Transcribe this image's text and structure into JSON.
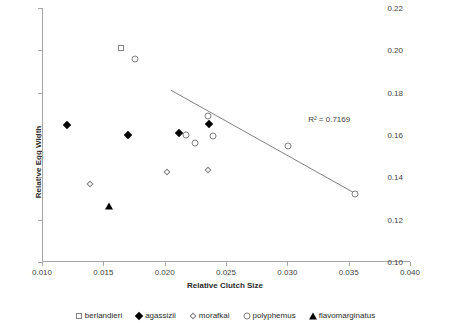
{
  "chart_data": {
    "type": "scatter",
    "title": "",
    "xlabel": "Relative Clutch Size",
    "ylabel": "Relative Egg Width",
    "xlim": [
      0.01,
      0.04
    ],
    "ylim": [
      0.1,
      0.22
    ],
    "xticks": [
      "0.010",
      "0.015",
      "0.020",
      "0.025",
      "0.030",
      "0.035",
      "0.040"
    ],
    "xtick_values": [
      0.01,
      0.015,
      0.02,
      0.025,
      0.03,
      0.035,
      0.04
    ],
    "yticks": [
      "0.10",
      "0.12",
      "0.14",
      "0.16",
      "0.18",
      "0.20",
      "0.22"
    ],
    "ytick_values": [
      0.1,
      0.12,
      0.14,
      0.16,
      0.18,
      0.2,
      0.22
    ],
    "grid": false,
    "legend_position": "bottom",
    "annotations": [
      {
        "text": "R² = 0.7169",
        "x": 0.0317,
        "y": 0.1695
      }
    ],
    "trendline": {
      "x0": 0.0205,
      "y0": 0.1812,
      "x1": 0.0355,
      "y1": 0.1325,
      "r_squared": 0.7169
    },
    "series": [
      {
        "name": "berlandieri",
        "marker": "open-square",
        "points": [
          {
            "x": 0.01645,
            "y": 0.2012
          }
        ]
      },
      {
        "name": "agassizii",
        "marker": "filled-diamond",
        "points": [
          {
            "x": 0.01205,
            "y": 0.1645
          },
          {
            "x": 0.01705,
            "y": 0.16
          },
          {
            "x": 0.02115,
            "y": 0.1608
          },
          {
            "x": 0.0236,
            "y": 0.1652
          }
        ]
      },
      {
        "name": "morafkai",
        "marker": "open-diamond",
        "points": [
          {
            "x": 0.01395,
            "y": 0.137
          },
          {
            "x": 0.02015,
            "y": 0.1425
          },
          {
            "x": 0.02355,
            "y": 0.1435
          }
        ]
      },
      {
        "name": "polyphemus",
        "marker": "open-circle",
        "points": [
          {
            "x": 0.01755,
            "y": 0.1958
          },
          {
            "x": 0.0217,
            "y": 0.1598
          },
          {
            "x": 0.02245,
            "y": 0.1562
          },
          {
            "x": 0.02355,
            "y": 0.169
          },
          {
            "x": 0.0239,
            "y": 0.1595
          },
          {
            "x": 0.03005,
            "y": 0.1548
          },
          {
            "x": 0.0355,
            "y": 0.1322
          }
        ]
      },
      {
        "name": "flavomarginatus",
        "marker": "filled-triangle",
        "points": [
          {
            "x": 0.01545,
            "y": 0.1265
          }
        ]
      }
    ]
  },
  "legend": {
    "items": [
      {
        "label": "berlandieri",
        "marker": "open-square"
      },
      {
        "label": "agassizii",
        "marker": "filled-diamond"
      },
      {
        "label": "morafkai",
        "marker": "open-diamond"
      },
      {
        "label": "polyphemus",
        "marker": "open-circle"
      },
      {
        "label": "flavomarginatus",
        "marker": "filled-triangle"
      }
    ]
  },
  "colors": {
    "axis": "#a6a6a6",
    "tick_text": "#3f3f3f",
    "marker_outline": "#808080",
    "marker_fill": "#000000",
    "trendline": "#7f7f7f",
    "background": "#ffffff"
  }
}
